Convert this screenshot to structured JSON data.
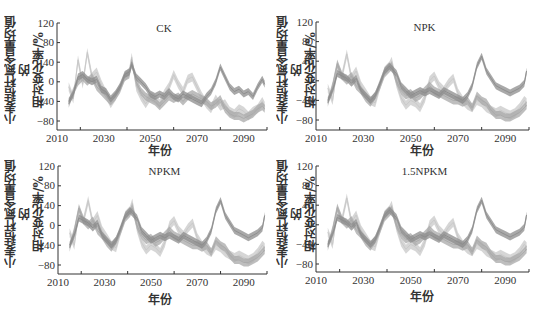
{
  "chart_data": [
    {
      "type": "area",
      "title": "CK",
      "xlabel": "年份",
      "ylabel_lines": [
        "小麦秸秆氮含量均值的",
        "相对变化率/%"
      ],
      "xlim": [
        2010,
        2100
      ],
      "ylim": [
        -100,
        120
      ],
      "xticks": [
        2010,
        2030,
        2050,
        2070,
        2090
      ],
      "xminor": [
        2020,
        2040,
        2060,
        2080,
        2100
      ],
      "yticks": [
        120,
        80,
        40,
        0,
        -40,
        -80
      ],
      "grid": false,
      "x": [
        2015,
        2017,
        2019,
        2021,
        2023,
        2025,
        2027,
        2029,
        2031,
        2033,
        2035,
        2037,
        2039,
        2041,
        2042,
        2044,
        2046,
        2048,
        2050,
        2052,
        2054,
        2056,
        2058,
        2060,
        2062,
        2064,
        2066,
        2068,
        2070,
        2072,
        2074,
        2076,
        2078,
        2080,
        2082,
        2084,
        2086,
        2088,
        2090,
        2092,
        2094,
        2096,
        2098,
        2099
      ],
      "series": [
        {
          "name": "band-light",
          "color": "#c8c8c8",
          "values": [
            -10,
            -35,
            45,
            -5,
            60,
            10,
            20,
            -5,
            -25,
            -45,
            -30,
            -10,
            10,
            20,
            50,
            -10,
            -30,
            -45,
            -30,
            -35,
            -45,
            -25,
            -10,
            15,
            -5,
            -20,
            5,
            10,
            -10,
            -30,
            -45,
            -55,
            -35,
            -50,
            -45,
            -60,
            -65,
            -55,
            -60,
            -70,
            -60,
            -55,
            -40,
            -50
          ]
        },
        {
          "name": "band-mid",
          "color": "#a8a8a8",
          "values": [
            -45,
            -20,
            0,
            10,
            0,
            10,
            -10,
            -20,
            -30,
            -40,
            -30,
            -15,
            10,
            15,
            40,
            0,
            -20,
            -30,
            -35,
            -40,
            -50,
            -40,
            -30,
            -35,
            -30,
            -40,
            -30,
            -25,
            -30,
            -35,
            -40,
            -50,
            -45,
            -35,
            -55,
            -65,
            -70,
            -70,
            -75,
            -70,
            -65,
            -55,
            -50,
            -55
          ]
        },
        {
          "name": "band-dark",
          "color": "#8c8c8c",
          "values": [
            -40,
            -25,
            10,
            15,
            5,
            0,
            5,
            -15,
            -20,
            -35,
            -25,
            -10,
            15,
            20,
            35,
            10,
            0,
            -10,
            -25,
            -30,
            -25,
            -30,
            -20,
            -30,
            -35,
            -25,
            -30,
            -35,
            -40,
            -45,
            -30,
            -20,
            0,
            30,
            10,
            -10,
            -20,
            -15,
            -25,
            -20,
            -30,
            -10,
            5,
            -5
          ]
        }
      ]
    },
    {
      "type": "area",
      "title": "NPK",
      "xlabel": "年份",
      "ylabel_lines": [
        "小麦秸秆氮含量均值的",
        "相对变化率/%"
      ],
      "xlim": [
        2010,
        2100
      ],
      "ylim": [
        -100,
        120
      ],
      "xticks": [
        2010,
        2030,
        2050,
        2070,
        2090
      ],
      "xminor": [
        2020,
        2040,
        2060,
        2080,
        2100
      ],
      "yticks": [
        120,
        80,
        40,
        0,
        -40,
        -80
      ],
      "grid": false,
      "x": [
        2015,
        2017,
        2019,
        2021,
        2023,
        2025,
        2027,
        2029,
        2031,
        2033,
        2035,
        2037,
        2039,
        2041,
        2042,
        2044,
        2046,
        2048,
        2050,
        2052,
        2054,
        2056,
        2058,
        2060,
        2062,
        2064,
        2066,
        2068,
        2070,
        2072,
        2074,
        2076,
        2078,
        2080,
        2082,
        2084,
        2086,
        2088,
        2090,
        2092,
        2094,
        2096,
        2098,
        2099
      ],
      "series": [
        {
          "name": "band-light",
          "color": "#c8c8c8",
          "values": [
            -15,
            -40,
            30,
            10,
            55,
            5,
            20,
            -10,
            -25,
            -40,
            -45,
            -10,
            20,
            30,
            40,
            -5,
            -35,
            -50,
            -40,
            -45,
            -55,
            -35,
            0,
            10,
            -10,
            -20,
            -5,
            5,
            -25,
            -40,
            -50,
            -55,
            -40,
            -45,
            -55,
            -60,
            -65,
            -60,
            -65,
            -70,
            -65,
            -55,
            -40,
            -45
          ]
        },
        {
          "name": "band-mid",
          "color": "#a8a8a8",
          "values": [
            -45,
            -10,
            35,
            10,
            0,
            10,
            -10,
            -20,
            -35,
            -45,
            -30,
            -10,
            15,
            25,
            30,
            0,
            -20,
            -30,
            -25,
            -35,
            -30,
            -20,
            -10,
            -20,
            -25,
            -30,
            -35,
            -40,
            -40,
            -45,
            -40,
            -55,
            -30,
            -40,
            -45,
            -60,
            -70,
            -70,
            -75,
            -75,
            -70,
            -65,
            -55,
            -50
          ]
        },
        {
          "name": "band-dark",
          "color": "#8c8c8c",
          "values": [
            -40,
            -20,
            15,
            10,
            5,
            -5,
            5,
            -20,
            -30,
            -40,
            -30,
            -5,
            20,
            30,
            25,
            15,
            -10,
            -20,
            -30,
            -25,
            -20,
            -25,
            -20,
            -25,
            -30,
            -20,
            -25,
            -30,
            -35,
            -40,
            -30,
            -10,
            30,
            50,
            20,
            5,
            -10,
            -15,
            -20,
            -25,
            -20,
            -15,
            -5,
            20
          ]
        }
      ]
    },
    {
      "type": "area",
      "title": "NPKM",
      "xlabel": "年份",
      "ylabel_lines": [
        "小麦秸秆氮含量均值的",
        "相对变化率/%"
      ],
      "xlim": [
        2010,
        2100
      ],
      "ylim": [
        -100,
        120
      ],
      "xticks": [
        2010,
        2030,
        2050,
        2070,
        2090
      ],
      "xminor": [
        2020,
        2040,
        2060,
        2080,
        2100
      ],
      "yticks": [
        120,
        80,
        40,
        0,
        -40,
        -80
      ],
      "grid": false,
      "x": [
        2015,
        2017,
        2019,
        2021,
        2023,
        2025,
        2027,
        2029,
        2031,
        2033,
        2035,
        2037,
        2039,
        2041,
        2042,
        2044,
        2046,
        2048,
        2050,
        2052,
        2054,
        2056,
        2058,
        2060,
        2062,
        2064,
        2066,
        2068,
        2070,
        2072,
        2074,
        2076,
        2078,
        2080,
        2082,
        2084,
        2086,
        2088,
        2090,
        2092,
        2094,
        2096,
        2098,
        2099
      ],
      "series": [
        {
          "name": "band-light",
          "color": "#c8c8c8",
          "values": [
            -15,
            -40,
            30,
            10,
            50,
            5,
            20,
            -10,
            -25,
            -40,
            -45,
            -10,
            20,
            30,
            45,
            -5,
            -35,
            -50,
            -40,
            -45,
            -55,
            -35,
            0,
            10,
            -10,
            -20,
            -5,
            5,
            -25,
            -40,
            -50,
            -55,
            -40,
            -45,
            -55,
            -60,
            -65,
            -60,
            -65,
            -70,
            -65,
            -55,
            -40,
            -45
          ]
        },
        {
          "name": "band-mid",
          "color": "#a8a8a8",
          "values": [
            -45,
            -10,
            35,
            10,
            0,
            10,
            -10,
            -20,
            -35,
            -45,
            -30,
            -10,
            15,
            25,
            35,
            0,
            -20,
            -30,
            -25,
            -35,
            -30,
            -20,
            -10,
            -20,
            -25,
            -30,
            -35,
            -40,
            -40,
            -45,
            -40,
            -55,
            -30,
            -40,
            -45,
            -60,
            -70,
            -70,
            -75,
            -75,
            -70,
            -65,
            -55,
            -50
          ]
        },
        {
          "name": "band-dark",
          "color": "#8c8c8c",
          "values": [
            -40,
            -20,
            15,
            10,
            5,
            -5,
            5,
            -20,
            -30,
            -40,
            -30,
            -5,
            20,
            30,
            25,
            15,
            -10,
            -20,
            -30,
            -25,
            -20,
            -25,
            -20,
            -25,
            -30,
            -20,
            -25,
            -30,
            -35,
            -40,
            -30,
            -10,
            30,
            50,
            20,
            5,
            -10,
            -15,
            -20,
            -25,
            -20,
            -15,
            -5,
            20
          ]
        }
      ]
    },
    {
      "type": "area",
      "title": "1.5NPKM",
      "xlabel": "年份",
      "ylabel_lines": [
        "小麦秸秆氮含量均值的",
        "相对变化率/%"
      ],
      "xlim": [
        2010,
        2100
      ],
      "ylim": [
        -100,
        120
      ],
      "xticks": [
        2010,
        2030,
        2050,
        2070,
        2090
      ],
      "xminor": [
        2020,
        2040,
        2060,
        2080,
        2100
      ],
      "yticks": [
        120,
        80,
        40,
        0,
        -40,
        -80
      ],
      "grid": false,
      "x": [
        2015,
        2017,
        2019,
        2021,
        2023,
        2025,
        2027,
        2029,
        2031,
        2033,
        2035,
        2037,
        2039,
        2041,
        2042,
        2044,
        2046,
        2048,
        2050,
        2052,
        2054,
        2056,
        2058,
        2060,
        2062,
        2064,
        2066,
        2068,
        2070,
        2072,
        2074,
        2076,
        2078,
        2080,
        2082,
        2084,
        2086,
        2088,
        2090,
        2092,
        2094,
        2096,
        2098,
        2099
      ],
      "series": [
        {
          "name": "band-light",
          "color": "#c8c8c8",
          "values": [
            -15,
            -40,
            30,
            10,
            55,
            5,
            20,
            -10,
            -25,
            -40,
            -45,
            -10,
            20,
            30,
            40,
            -5,
            -35,
            -50,
            -40,
            -45,
            -55,
            -35,
            0,
            10,
            -10,
            -20,
            -5,
            5,
            -25,
            -40,
            -50,
            -55,
            -40,
            -45,
            -55,
            -60,
            -65,
            -60,
            -65,
            -70,
            -65,
            -55,
            -40,
            -45
          ]
        },
        {
          "name": "band-mid",
          "color": "#a8a8a8",
          "values": [
            -45,
            -10,
            35,
            10,
            0,
            10,
            -10,
            -20,
            -35,
            -45,
            -30,
            -10,
            15,
            25,
            30,
            0,
            -20,
            -30,
            -25,
            -35,
            -30,
            -20,
            -10,
            -20,
            -25,
            -30,
            -35,
            -40,
            -40,
            -45,
            -40,
            -55,
            -30,
            -40,
            -45,
            -60,
            -70,
            -70,
            -75,
            -75,
            -70,
            -65,
            -55,
            -50
          ]
        },
        {
          "name": "band-dark",
          "color": "#8c8c8c",
          "values": [
            -40,
            -20,
            15,
            10,
            5,
            -5,
            5,
            -20,
            -30,
            -40,
            -30,
            -5,
            20,
            30,
            25,
            15,
            -10,
            -20,
            -30,
            -25,
            -20,
            -25,
            -20,
            -25,
            -30,
            -20,
            -25,
            -30,
            -35,
            -40,
            -30,
            -10,
            30,
            50,
            20,
            5,
            -10,
            -15,
            -20,
            -25,
            -20,
            -15,
            -5,
            20
          ]
        }
      ]
    }
  ],
  "panels": [
    {
      "title": "CK",
      "xlabel": "年份",
      "ylabel_1": "小麦秸秆氮含量均值的",
      "ylabel_2": "相对变化率/%"
    },
    {
      "title": "NPK",
      "xlabel": "年份",
      "ylabel_1": "小麦秸秆氮含量均值的",
      "ylabel_2": "相对变化率/%"
    },
    {
      "title": "NPKM",
      "xlabel": "年份",
      "ylabel_1": "小麦秸秆氮含量均值的",
      "ylabel_2": "相对变化率/%"
    },
    {
      "title": "1.5NPKM",
      "xlabel": "年份",
      "ylabel_1": "小麦秸秆氮含量均值的",
      "ylabel_2": "相对变化率/%"
    }
  ]
}
